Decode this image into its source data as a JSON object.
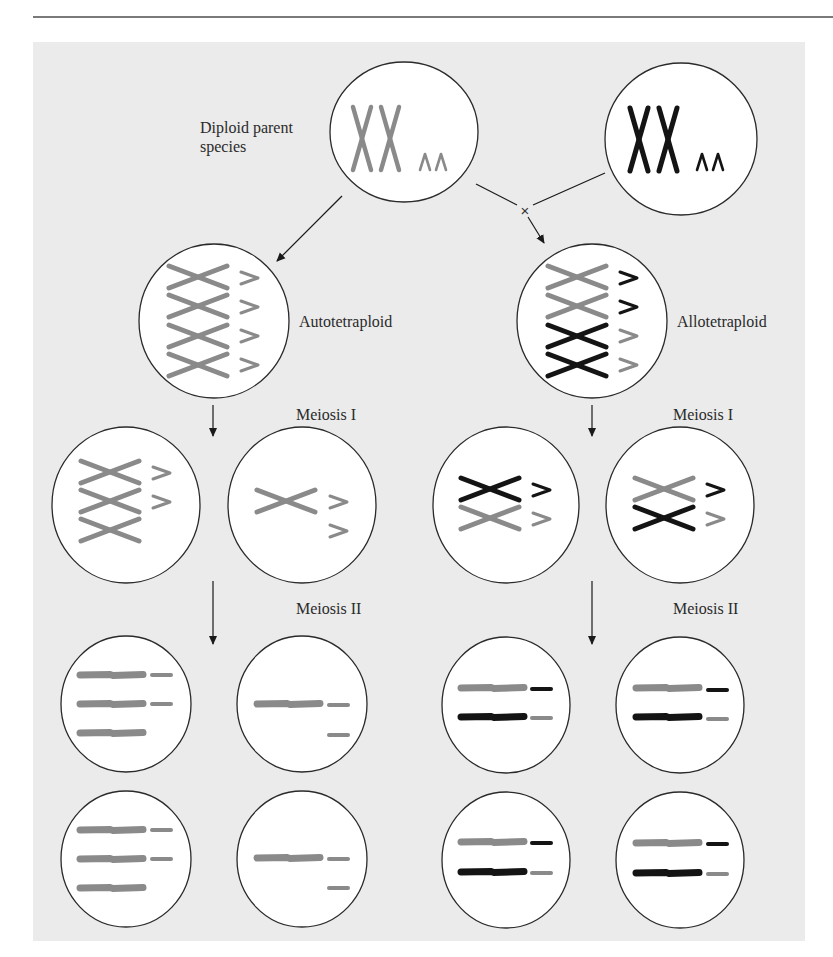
{
  "figure": {
    "labels": {
      "diploid_parent": "Diploid parent species",
      "autotetraploid": "Autotetraploid",
      "allotetraploid": "Allotetraploid",
      "meiosis_1_left": "Meiosis I",
      "meiosis_1_right": "Meiosis I",
      "meiosis_2_left": "Meiosis II",
      "meiosis_2_right": "Meiosis II"
    },
    "cross_symbol": "×",
    "colors": {
      "panel_bg": "#ebebeb",
      "cell_fill": "#ffffff",
      "cell_stroke": "#2a2a2a",
      "species_a_gray": "#8a8a8a",
      "species_b_black": "#141414",
      "arrow": "#1a1a1a"
    },
    "cells": [
      {
        "id": "parent-a",
        "role": "diploid parent (gray)",
        "cx": 404,
        "cy": 132,
        "rx": 74,
        "ry": 70
      },
      {
        "id": "parent-b",
        "role": "diploid parent (black)",
        "cx": 681,
        "cy": 139,
        "rx": 76,
        "ry": 76
      },
      {
        "id": "autotetraploid",
        "role": "autotetraploid",
        "cx": 214,
        "cy": 321,
        "rx": 75,
        "ry": 77
      },
      {
        "id": "allotetraploid",
        "role": "allotetraploid",
        "cx": 592,
        "cy": 321,
        "rx": 75,
        "ry": 77
      },
      {
        "id": "auto-m1-a",
        "role": "autotetraploid meiosis I product 1",
        "cx": 126,
        "cy": 505,
        "rx": 74,
        "ry": 78
      },
      {
        "id": "auto-m1-b",
        "role": "autotetraploid meiosis I product 2",
        "cx": 302,
        "cy": 505,
        "rx": 74,
        "ry": 78
      },
      {
        "id": "allo-m1-a",
        "role": "allotetraploid meiosis I product 1",
        "cx": 506,
        "cy": 505,
        "rx": 73,
        "ry": 78
      },
      {
        "id": "allo-m1-b",
        "role": "allotetraploid meiosis I product 2",
        "cx": 680,
        "cy": 505,
        "rx": 74,
        "ry": 78
      },
      {
        "id": "auto-m2-a1",
        "role": "autotetraploid meiosis II gamete",
        "cx": 126,
        "cy": 704,
        "rx": 65,
        "ry": 68
      },
      {
        "id": "auto-m2-b1",
        "role": "autotetraploid meiosis II gamete",
        "cx": 302,
        "cy": 704,
        "rx": 65,
        "ry": 68
      },
      {
        "id": "allo-m2-a1",
        "role": "allotetraploid meiosis II gamete",
        "cx": 506,
        "cy": 705,
        "rx": 64,
        "ry": 68
      },
      {
        "id": "allo-m2-b1",
        "role": "allotetraploid meiosis II gamete",
        "cx": 680,
        "cy": 705,
        "rx": 64,
        "ry": 68
      },
      {
        "id": "auto-m2-a2",
        "role": "autotetraploid meiosis II gamete",
        "cx": 126,
        "cy": 859,
        "rx": 65,
        "ry": 68
      },
      {
        "id": "auto-m2-b2",
        "role": "autotetraploid meiosis II gamete",
        "cx": 302,
        "cy": 859,
        "rx": 65,
        "ry": 68
      },
      {
        "id": "allo-m2-a2",
        "role": "allotetraploid meiosis II gamete",
        "cx": 506,
        "cy": 860,
        "rx": 64,
        "ry": 68
      },
      {
        "id": "allo-m2-b2",
        "role": "allotetraploid meiosis II gamete",
        "cx": 680,
        "cy": 860,
        "rx": 64,
        "ry": 68
      }
    ],
    "chromosomes": {
      "upright_x": [
        {
          "x": 350,
          "y": 107,
          "w": 24,
          "h": 63,
          "color": "gray"
        },
        {
          "x": 378,
          "y": 107,
          "w": 24,
          "h": 63,
          "color": "gray"
        },
        {
          "x": 627,
          "y": 108,
          "w": 24,
          "h": 63,
          "color": "black"
        },
        {
          "x": 656,
          "y": 108,
          "w": 24,
          "h": 63,
          "color": "black"
        }
      ],
      "small_caret": [
        {
          "x": 420,
          "y": 154,
          "color": "gray"
        },
        {
          "x": 436,
          "y": 154,
          "color": "gray"
        },
        {
          "x": 697,
          "y": 154,
          "color": "black"
        },
        {
          "x": 713,
          "y": 154,
          "color": "black"
        }
      ],
      "crossed_x": [
        {
          "x": 169,
          "y": 266,
          "color": "gray"
        },
        {
          "x": 169,
          "y": 295,
          "color": "gray"
        },
        {
          "x": 169,
          "y": 325,
          "color": "gray"
        },
        {
          "x": 169,
          "y": 354,
          "color": "gray"
        },
        {
          "x": 548,
          "y": 266,
          "color": "gray"
        },
        {
          "x": 548,
          "y": 295,
          "color": "gray"
        },
        {
          "x": 548,
          "y": 325,
          "color": "black"
        },
        {
          "x": 548,
          "y": 354,
          "color": "black"
        },
        {
          "x": 81,
          "y": 461,
          "color": "gray"
        },
        {
          "x": 81,
          "y": 490,
          "color": "gray"
        },
        {
          "x": 81,
          "y": 519,
          "color": "gray"
        },
        {
          "x": 257,
          "y": 490,
          "color": "gray"
        },
        {
          "x": 461,
          "y": 478,
          "color": "black"
        },
        {
          "x": 461,
          "y": 507,
          "color": "gray"
        },
        {
          "x": 635,
          "y": 478,
          "color": "gray"
        },
        {
          "x": 635,
          "y": 507,
          "color": "black"
        }
      ],
      "wedge": [
        {
          "x": 241,
          "y": 272,
          "color": "gray"
        },
        {
          "x": 241,
          "y": 301,
          "color": "gray"
        },
        {
          "x": 241,
          "y": 330,
          "color": "gray"
        },
        {
          "x": 241,
          "y": 359,
          "color": "gray"
        },
        {
          "x": 620,
          "y": 272,
          "color": "black"
        },
        {
          "x": 620,
          "y": 301,
          "color": "black"
        },
        {
          "x": 620,
          "y": 330,
          "color": "gray"
        },
        {
          "x": 620,
          "y": 359,
          "color": "gray"
        },
        {
          "x": 153,
          "y": 467,
          "color": "gray"
        },
        {
          "x": 153,
          "y": 496,
          "color": "gray"
        },
        {
          "x": 330,
          "y": 496,
          "color": "gray"
        },
        {
          "x": 330,
          "y": 525,
          "color": "gray"
        },
        {
          "x": 533,
          "y": 484,
          "color": "black"
        },
        {
          "x": 533,
          "y": 513,
          "color": "gray"
        },
        {
          "x": 707,
          "y": 484,
          "color": "black"
        },
        {
          "x": 707,
          "y": 513,
          "color": "gray"
        }
      ],
      "bar_long": [
        {
          "x": 80,
          "y": 675,
          "color": "gray"
        },
        {
          "x": 80,
          "y": 704,
          "color": "gray"
        },
        {
          "x": 80,
          "y": 733,
          "color": "gray"
        },
        {
          "x": 257,
          "y": 704,
          "color": "gray"
        },
        {
          "x": 461,
          "y": 688,
          "color": "gray"
        },
        {
          "x": 461,
          "y": 717,
          "color": "black"
        },
        {
          "x": 636,
          "y": 688,
          "color": "gray"
        },
        {
          "x": 636,
          "y": 717,
          "color": "black"
        },
        {
          "x": 80,
          "y": 830,
          "color": "gray"
        },
        {
          "x": 80,
          "y": 859,
          "color": "gray"
        },
        {
          "x": 80,
          "y": 888,
          "color": "gray"
        },
        {
          "x": 257,
          "y": 858,
          "color": "gray"
        },
        {
          "x": 461,
          "y": 842,
          "color": "gray"
        },
        {
          "x": 461,
          "y": 872,
          "color": "black"
        },
        {
          "x": 636,
          "y": 843,
          "color": "gray"
        },
        {
          "x": 636,
          "y": 873,
          "color": "black"
        }
      ],
      "bar_short": [
        {
          "x": 152,
          "y": 675,
          "color": "gray"
        },
        {
          "x": 152,
          "y": 704,
          "color": "gray"
        },
        {
          "x": 329,
          "y": 705,
          "color": "gray"
        },
        {
          "x": 329,
          "y": 735,
          "color": "gray"
        },
        {
          "x": 532,
          "y": 689,
          "color": "black"
        },
        {
          "x": 532,
          "y": 718,
          "color": "gray"
        },
        {
          "x": 708,
          "y": 690,
          "color": "black"
        },
        {
          "x": 708,
          "y": 719,
          "color": "gray"
        },
        {
          "x": 152,
          "y": 830,
          "color": "gray"
        },
        {
          "x": 152,
          "y": 859,
          "color": "gray"
        },
        {
          "x": 329,
          "y": 859,
          "color": "gray"
        },
        {
          "x": 329,
          "y": 888,
          "color": "gray"
        },
        {
          "x": 532,
          "y": 843,
          "color": "black"
        },
        {
          "x": 532,
          "y": 873,
          "color": "gray"
        },
        {
          "x": 708,
          "y": 844,
          "color": "black"
        },
        {
          "x": 708,
          "y": 874,
          "color": "gray"
        }
      ]
    },
    "arrows": [
      {
        "id": "parent-to-auto",
        "x1": 342,
        "y1": 196,
        "x2": 277,
        "y2": 261,
        "head": true
      },
      {
        "id": "parent-a-to-cross",
        "x1": 476,
        "y1": 184,
        "x2": 517,
        "y2": 205,
        "head": false
      },
      {
        "id": "parent-b-to-cross",
        "x1": 605,
        "y1": 173,
        "x2": 533,
        "y2": 205,
        "head": false
      },
      {
        "id": "cross-to-allo",
        "x1": 528,
        "y1": 217,
        "x2": 544,
        "y2": 243,
        "head": true
      },
      {
        "id": "auto-meiosis-1",
        "x1": 213,
        "y1": 405,
        "x2": 213,
        "y2": 436,
        "head": true
      },
      {
        "id": "allo-meiosis-1",
        "x1": 592,
        "y1": 405,
        "x2": 592,
        "y2": 436,
        "head": true
      },
      {
        "id": "auto-meiosis-2",
        "x1": 213,
        "y1": 581,
        "x2": 213,
        "y2": 644,
        "head": true
      },
      {
        "id": "allo-meiosis-2",
        "x1": 592,
        "y1": 581,
        "x2": 592,
        "y2": 644,
        "head": true
      }
    ],
    "cross_position": {
      "x": 525,
      "y": 211
    }
  }
}
